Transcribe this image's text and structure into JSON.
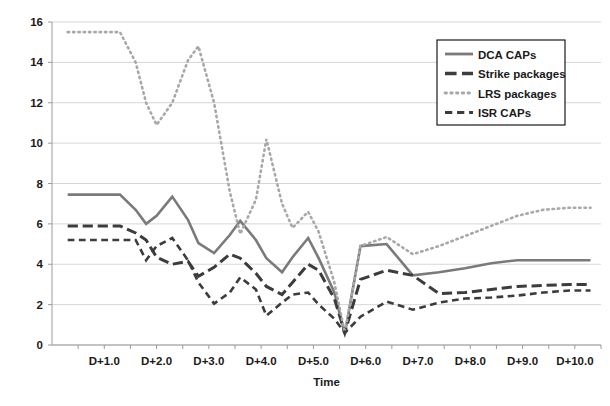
{
  "chart_data": {
    "type": "line",
    "title": "",
    "xlabel": "Time",
    "ylabel": "",
    "xlim": [
      0.0,
      10.5
    ],
    "ylim": [
      0,
      16
    ],
    "yticks": [
      0,
      2,
      4,
      6,
      8,
      10,
      12,
      14,
      16
    ],
    "ytick_labels": [
      "0",
      "2",
      "4",
      "6",
      "8",
      "10",
      "12",
      "14",
      "16"
    ],
    "xticks": [
      1.0,
      2.0,
      3.0,
      4.0,
      5.0,
      6.0,
      7.0,
      8.0,
      9.0,
      10.0
    ],
    "xtick_labels": [
      "D+1.0",
      "D+2.0",
      "D+3.0",
      "D+4.0",
      "D+5.0",
      "D+6.0",
      "D+7.0",
      "D+8.0",
      "D+9.0",
      "D+10.0"
    ],
    "xtick_minor_step": 0.5,
    "grid": "horizontal",
    "legend_position": "top-right",
    "x": [
      0.3,
      0.8,
      1.3,
      1.6,
      1.8,
      2.0,
      2.3,
      2.6,
      2.8,
      3.1,
      3.4,
      3.6,
      3.9,
      4.1,
      4.4,
      4.6,
      4.9,
      5.1,
      5.4,
      5.6,
      5.9,
      6.4,
      6.9,
      7.4,
      7.9,
      8.4,
      8.9,
      9.4,
      9.9,
      10.3
    ],
    "series": [
      {
        "name": "DCA CAPs",
        "style": "solid",
        "color": "#7a7a7a",
        "width": 2.6,
        "values": [
          7.45,
          7.45,
          7.45,
          6.7,
          6.0,
          6.4,
          7.35,
          6.2,
          5.05,
          4.55,
          5.45,
          6.15,
          5.2,
          4.3,
          3.6,
          4.35,
          5.3,
          4.3,
          2.6,
          0.55,
          4.9,
          5.0,
          3.45,
          3.6,
          3.8,
          4.05,
          4.2,
          4.2,
          4.2,
          4.2
        ]
      },
      {
        "name": "Strike packages",
        "style": "long-dash",
        "color": "#3c3c3c",
        "width": 3.0,
        "values": [
          5.9,
          5.9,
          5.9,
          5.55,
          5.2,
          4.35,
          4.0,
          4.15,
          3.4,
          3.85,
          4.5,
          4.3,
          3.55,
          2.9,
          2.5,
          3.1,
          4.0,
          3.7,
          2.3,
          0.6,
          3.25,
          3.7,
          3.45,
          2.55,
          2.6,
          2.75,
          2.9,
          2.95,
          3.0,
          3.0
        ]
      },
      {
        "name": "LRS packages",
        "style": "dotted",
        "color": "#a8a8a8",
        "width": 2.6,
        "values": [
          15.5,
          15.5,
          15.5,
          14.0,
          12.0,
          10.9,
          12.0,
          14.1,
          14.8,
          12.0,
          7.6,
          5.5,
          7.2,
          10.2,
          7.0,
          5.8,
          6.6,
          5.6,
          3.1,
          0.6,
          4.9,
          5.35,
          4.5,
          4.9,
          5.4,
          5.9,
          6.4,
          6.7,
          6.8,
          6.8
        ]
      },
      {
        "name": "ISR CAPs",
        "style": "dash",
        "color": "#3c3c3c",
        "width": 2.6,
        "values": [
          5.2,
          5.2,
          5.2,
          5.2,
          4.2,
          4.9,
          5.3,
          4.2,
          3.1,
          2.05,
          2.6,
          3.35,
          2.75,
          1.45,
          2.1,
          2.5,
          2.6,
          2.0,
          1.3,
          0.6,
          1.4,
          2.15,
          1.75,
          2.1,
          2.3,
          2.35,
          2.45,
          2.6,
          2.7,
          2.7
        ]
      }
    ],
    "legend": [
      {
        "label": "DCA CAPs",
        "style": "solid",
        "color": "#7a7a7a"
      },
      {
        "label": "Strike packages",
        "style": "long-dash",
        "color": "#3c3c3c"
      },
      {
        "label": "LRS packages",
        "style": "dotted",
        "color": "#a8a8a8"
      },
      {
        "label": "ISR CAPs",
        "style": "dash",
        "color": "#3c3c3c"
      }
    ]
  }
}
